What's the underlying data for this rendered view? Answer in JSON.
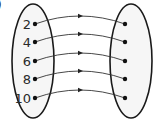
{
  "figure": {
    "corner_mark": ")",
    "domain_set": {
      "elements": [
        "2",
        "4",
        "6",
        "8",
        "10"
      ]
    },
    "codomain_set": {
      "elements": [
        "",
        "",
        "",
        "",
        ""
      ]
    },
    "mapping": [
      {
        "from": "2",
        "to_index": 0
      },
      {
        "from": "4",
        "to_index": 1
      },
      {
        "from": "6",
        "to_index": 2
      },
      {
        "from": "8",
        "to_index": 3
      },
      {
        "from": "10",
        "to_index": 4
      }
    ],
    "colors": {
      "outline": "#1a1a1a",
      "fill": "#f6f6f6",
      "text": "#2a2a2a"
    }
  }
}
